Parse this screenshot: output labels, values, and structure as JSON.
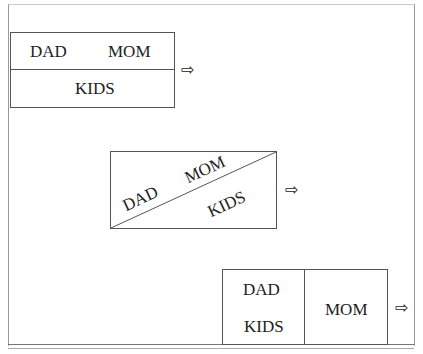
{
  "diagrams": [
    {
      "layout": "horizontal-split",
      "top_left": "DAD",
      "top_right": "MOM",
      "bottom": "KIDS",
      "arrow": "⇨"
    },
    {
      "layout": "diagonal-split",
      "upper_left": "DAD",
      "upper_right": "MOM",
      "lower": "KIDS",
      "arrow": "⇨"
    },
    {
      "layout": "vertical-split",
      "left_top": "DAD",
      "left_bottom": "KIDS",
      "right": "MOM",
      "arrow": "⇨"
    }
  ]
}
